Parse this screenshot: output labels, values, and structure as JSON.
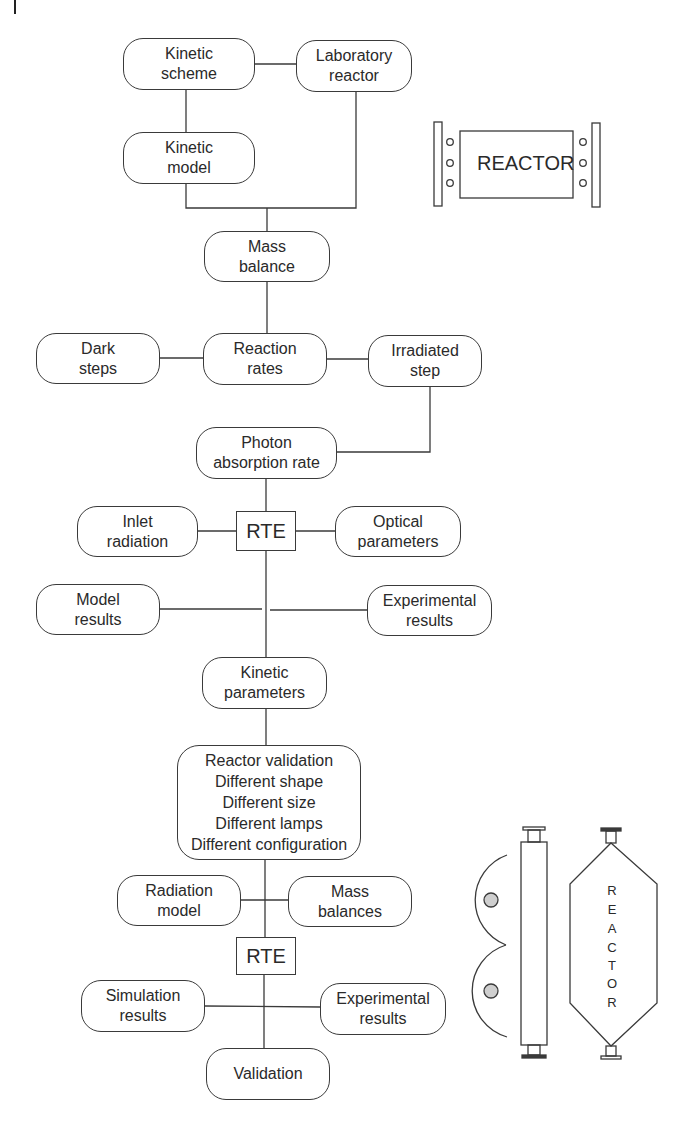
{
  "diagram": {
    "type": "flowchart",
    "nodes": {
      "kinetic_scheme": {
        "lines": [
          "Kinetic",
          "scheme"
        ]
      },
      "laboratory_reactor": {
        "lines": [
          "Laboratory",
          "reactor"
        ]
      },
      "kinetic_model": {
        "lines": [
          "Kinetic",
          "model"
        ]
      },
      "mass_balance": {
        "lines": [
          "Mass",
          "balance"
        ]
      },
      "dark_steps": {
        "lines": [
          "Dark",
          "steps"
        ]
      },
      "reaction_rates": {
        "lines": [
          "Reaction",
          "rates"
        ]
      },
      "irradiated_step": {
        "lines": [
          "Irradiated",
          "step"
        ]
      },
      "photon_absorption_rate": {
        "lines": [
          "Photon",
          "absorption rate"
        ]
      },
      "inlet_radiation": {
        "lines": [
          "Inlet",
          "radiation"
        ]
      },
      "rte_1": {
        "lines": [
          "RTE"
        ]
      },
      "optical_parameters": {
        "lines": [
          "Optical",
          "parameters"
        ]
      },
      "model_results": {
        "lines": [
          "Model",
          "results"
        ]
      },
      "experimental_results_1": {
        "lines": [
          "Experimental",
          "results"
        ]
      },
      "kinetic_parameters": {
        "lines": [
          "Kinetic",
          "parameters"
        ]
      },
      "reactor_validation": {
        "lines": [
          "Reactor validation",
          "Different shape",
          "Different size",
          "Different lamps",
          "Different configuration"
        ]
      },
      "radiation_model": {
        "lines": [
          "Radiation",
          "model"
        ]
      },
      "mass_balances": {
        "lines": [
          "Mass",
          "balances"
        ]
      },
      "rte_2": {
        "lines": [
          "RTE"
        ]
      },
      "simulation_results": {
        "lines": [
          "Simulation",
          "results"
        ]
      },
      "experimental_results_2": {
        "lines": [
          "Experimental",
          "results"
        ]
      },
      "validation": {
        "lines": [
          "Validation"
        ]
      }
    },
    "edges": [
      [
        "kinetic_scheme",
        "laboratory_reactor"
      ],
      [
        "kinetic_scheme",
        "kinetic_model"
      ],
      [
        "kinetic_model",
        "mass_balance"
      ],
      [
        "laboratory_reactor",
        "mass_balance"
      ],
      [
        "mass_balance",
        "reaction_rates"
      ],
      [
        "dark_steps",
        "reaction_rates"
      ],
      [
        "reaction_rates",
        "irradiated_step"
      ],
      [
        "irradiated_step",
        "photon_absorption_rate"
      ],
      [
        "photon_absorption_rate",
        "rte_1"
      ],
      [
        "inlet_radiation",
        "rte_1"
      ],
      [
        "rte_1",
        "optical_parameters"
      ],
      [
        "rte_1",
        "kinetic_parameters"
      ],
      [
        "model_results",
        "experimental_results_1"
      ],
      [
        "kinetic_parameters",
        "reactor_validation"
      ],
      [
        "reactor_validation",
        "rte_2"
      ],
      [
        "radiation_model",
        "mass_balances"
      ],
      [
        "rte_2",
        "validation"
      ],
      [
        "simulation_results",
        "experimental_results_2"
      ]
    ]
  },
  "illustrations": {
    "flat_reactor": {
      "label": "REACTOR",
      "lamp_dots_per_side": 3
    },
    "tubular_reactor_with_lamps": {
      "lamp_count": 2
    },
    "hexagonal_reactor": {
      "label_letters": [
        "R",
        "E",
        "A",
        "C",
        "T",
        "O",
        "R"
      ]
    }
  }
}
